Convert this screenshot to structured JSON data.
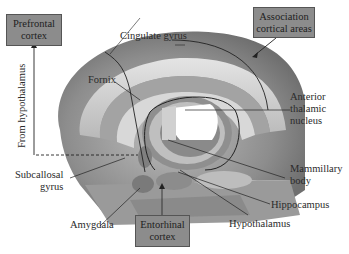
{
  "diagram": {
    "type": "anatomical-pathway",
    "boxes": {
      "prefrontal": [
        "Prefrontal",
        "cortex"
      ],
      "association": [
        "Association",
        "cortical areas"
      ],
      "entorhinal": [
        "Entorhinal",
        "cortex"
      ]
    },
    "labels": {
      "cingulate": "Cingulate gyrus",
      "fornix": "Fornix",
      "anterior_thalamic": [
        "Anterior",
        "thalamic",
        "nucleus"
      ],
      "mammillary": [
        "Mammillary",
        "body"
      ],
      "hippocampus": "Hippocampus",
      "hypothalamus": "Hypothalamus",
      "subcallosal": [
        "Subcallosal",
        "gyrus"
      ],
      "amygdala": "Amygdala",
      "from_hypothalamus": "From hypothalamus"
    },
    "colors": {
      "box_fill": "#8c8c8c",
      "brain_dark": "#7a7a7a",
      "brain_mid": "#a8a8a8",
      "brain_light": "#d6d6d6",
      "line": "#222222"
    }
  }
}
